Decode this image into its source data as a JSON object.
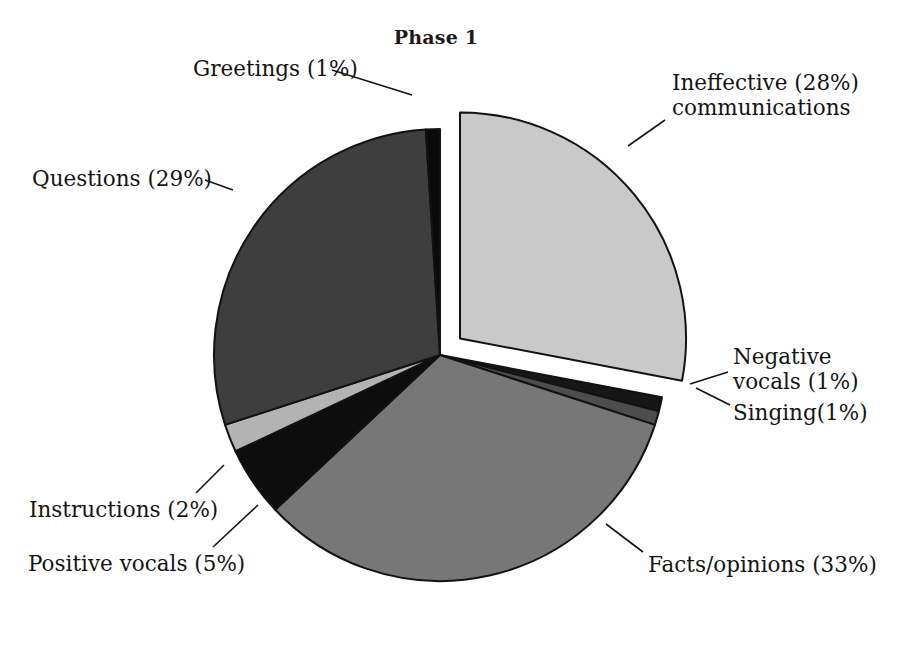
{
  "chart_data": {
    "type": "pie",
    "title": "Phase 1",
    "subtitle": "",
    "xlabel": "",
    "ylabel": "",
    "grid": false,
    "legend_position": "none",
    "value_unit": "percent",
    "total": 100,
    "labels_outside_with_leader_lines": true,
    "categories": [
      "Ineffective communications",
      "Negative vocals",
      "Singing",
      "Facts/opinions",
      "Positive vocals",
      "Instructions",
      "Questions",
      "Greetings"
    ],
    "values": [
      28,
      1,
      1,
      33,
      5,
      2,
      29,
      1
    ],
    "slices": [
      {
        "name": "Ineffective communications",
        "value": 28,
        "label": "Ineffective (28%)",
        "label_line2": "communications",
        "color": "#c9c9c9",
        "exploded": true
      },
      {
        "name": "Negative vocals",
        "value": 1,
        "label": "Negative",
        "label_line2": "vocals (1%)",
        "color": "#161616",
        "exploded": false
      },
      {
        "name": "Singing",
        "value": 1,
        "label": "Singing(1%)",
        "label_line2": "",
        "color": "#4d4d4d",
        "exploded": false
      },
      {
        "name": "Facts/opinions",
        "value": 33,
        "label": "Facts/opinions (33%)",
        "label_line2": "",
        "color": "#777777",
        "exploded": false
      },
      {
        "name": "Positive vocals",
        "value": 5,
        "label": "Positive vocals (5%)",
        "label_line2": "",
        "color": "#0d0d0d",
        "exploded": false
      },
      {
        "name": "Instructions",
        "value": 2,
        "label": "Instructions (2%)",
        "label_line2": "",
        "color": "#b3b3b3",
        "exploded": false
      },
      {
        "name": "Questions",
        "value": 29,
        "label": "Questions (29%)",
        "label_line2": "",
        "color": "#3e3e3e",
        "exploded": false
      },
      {
        "name": "Greetings",
        "value": 1,
        "label": "Greetings (1%)",
        "label_line2": "",
        "color": "#0a0a0a",
        "exploded": false
      }
    ]
  },
  "labels": {
    "ineffective_l1": "Ineffective (28%)",
    "ineffective_l2": "communications",
    "greetings": "Greetings (1%)",
    "questions": "Questions (29%)",
    "instructions": "Instructions (2%)",
    "positive_vocals": "Positive vocals (5%)",
    "negative_l1": "Negative",
    "negative_l2": "vocals (1%)",
    "singing": "Singing(1%)",
    "facts": "Facts/opinions (33%)"
  },
  "colors": {
    "ineffective": "#c9c9c9",
    "negative_vocals": "#161616",
    "singing": "#4d4d4d",
    "facts": "#777777",
    "positive_vocals": "#0d0d0d",
    "instructions": "#b3b3b3",
    "questions": "#3e3e3e",
    "greetings": "#0a0a0a",
    "outline": "#121212",
    "background": "#ffffff"
  }
}
